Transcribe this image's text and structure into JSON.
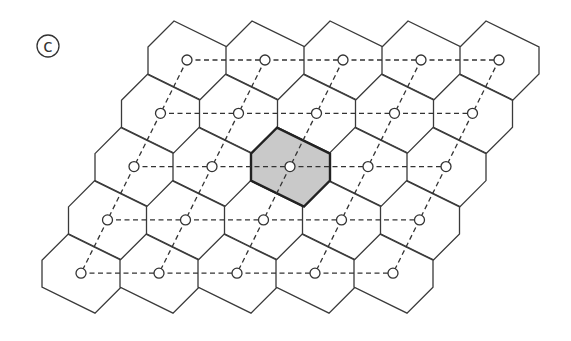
{
  "figure": {
    "panel_label": "c",
    "grid": {
      "rows": 5,
      "cols": 5,
      "origin": [
        187,
        60
      ],
      "col_step": [
        78,
        0
      ],
      "row_step": [
        -26.5,
        53.3
      ],
      "hex_vertices_relative": [
        [
          -39,
          -13
        ],
        [
          -13,
          -39
        ],
        [
          40,
          -13
        ],
        [
          40,
          14
        ],
        [
          14,
          40
        ],
        [
          -39,
          14
        ]
      ],
      "node_radius": 5,
      "highlighted_cell": {
        "row": 2,
        "col": 2
      }
    },
    "colors": {
      "line": "#3a3a3a",
      "highlight_fill": "#c9c9c9",
      "background": "#ffffff"
    }
  }
}
